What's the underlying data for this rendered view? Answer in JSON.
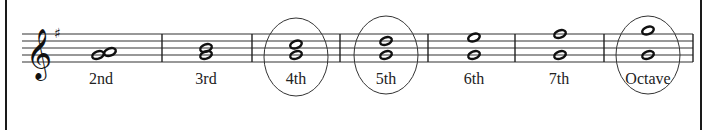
{
  "figure": {
    "clef": "treble-clef",
    "key_signature": "F-sharp (G major)",
    "intervals": [
      {
        "label": "2nd",
        "circled": false
      },
      {
        "label": "3rd",
        "circled": false
      },
      {
        "label": "4th",
        "circled": true
      },
      {
        "label": "5th",
        "circled": true
      },
      {
        "label": "6th",
        "circled": false
      },
      {
        "label": "7th",
        "circled": false
      },
      {
        "label": "Octave",
        "circled": true
      }
    ],
    "colors": {
      "ink": "#222222",
      "background": "#ffffff"
    }
  }
}
